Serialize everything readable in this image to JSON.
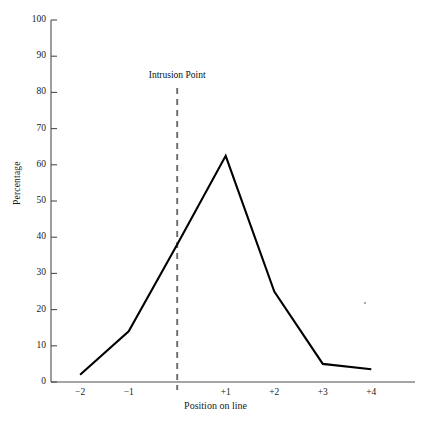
{
  "chart_data": {
    "type": "line",
    "title": "",
    "xlabel": "Position on line",
    "ylabel": "Percentage",
    "x": [
      -2,
      -1,
      0,
      1,
      2,
      3,
      4
    ],
    "xtick_labels": [
      "−2",
      "−1",
      "+1",
      "+2",
      "+3",
      "+4"
    ],
    "xtick_values": [
      -2,
      -1,
      1,
      2,
      3,
      4
    ],
    "values": [
      2,
      14,
      38,
      62.5,
      25,
      5,
      3.5
    ],
    "series": [
      {
        "name": "Percentage",
        "values": [
          2,
          14,
          38,
          62.5,
          25,
          5,
          3.5
        ]
      }
    ],
    "ytick_labels": [
      "0",
      "10",
      "20",
      "30",
      "40",
      "50",
      "60",
      "70",
      "80",
      "90",
      "100"
    ],
    "ytick_values": [
      0,
      10,
      20,
      30,
      40,
      50,
      60,
      70,
      80,
      90,
      100
    ],
    "ylim": [
      0,
      100
    ],
    "xlim": [
      -2.6,
      4.9
    ],
    "grid": false,
    "legend": "none",
    "line_color": "#000000",
    "axis_color": "#555555",
    "annotations": [
      {
        "label": "Intrusion Point",
        "x": 0,
        "type": "vertical-dashed-line",
        "color": "#6b6b6b"
      }
    ]
  }
}
